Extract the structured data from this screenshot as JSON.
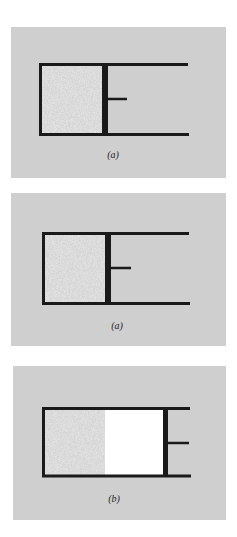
{
  "figure": {
    "colors": {
      "panel_bg": "#cfcfcf",
      "gas_fill": "#bdbdbd",
      "vacuum_fill": "#ffffff",
      "walls": "#1a1a1a"
    },
    "panels": [
      {
        "label": "(a)",
        "gas_fraction": "full",
        "description": "Cylinder with gas compressed by piston at left position"
      },
      {
        "label": "(a)",
        "gas_fraction": "full",
        "description": "Cylinder with gas compressed by piston at left position"
      },
      {
        "label": "(b)",
        "gas_fraction": "partial",
        "description": "Piston moved right; gas occupies left part, empty region between gas and piston"
      }
    ]
  }
}
